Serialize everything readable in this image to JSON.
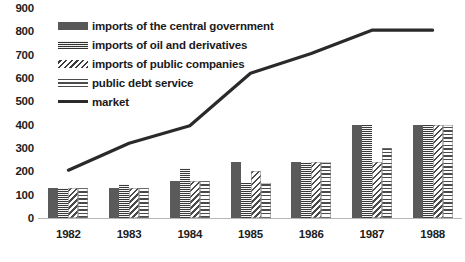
{
  "chart_data": {
    "type": "bar",
    "title": "",
    "subtitle": "",
    "xlabel": "",
    "ylabel": "",
    "categories": [
      "1982",
      "1983",
      "1984",
      "1985",
      "1986",
      "1987",
      "1988"
    ],
    "ylim": [
      0,
      900
    ],
    "y_ticks": [
      0,
      100,
      200,
      300,
      400,
      500,
      600,
      700,
      800,
      900
    ],
    "y_tick_labels": [
      "0",
      "100",
      "200",
      "300",
      "400",
      "500",
      "600",
      "700",
      "800",
      "900"
    ],
    "grid": false,
    "legend_position": "top-left",
    "series": [
      {
        "name": "imports of the central government",
        "kind": "bar",
        "pattern": "solid",
        "values": [
          130,
          130,
          160,
          240,
          240,
          400,
          400
        ]
      },
      {
        "name": "imports of oil and derivatives",
        "kind": "bar",
        "pattern": "dots",
        "values": [
          130,
          145,
          215,
          150,
          240,
          400,
          400
        ]
      },
      {
        "name": "imports of public companies",
        "kind": "bar",
        "pattern": "diagonal",
        "values": [
          130,
          130,
          160,
          200,
          240,
          240,
          400
        ]
      },
      {
        "name": "public debt service",
        "kind": "bar",
        "pattern": "horizontal",
        "values": [
          130,
          130,
          160,
          150,
          240,
          300,
          400
        ]
      },
      {
        "name": "market",
        "kind": "line",
        "pattern": "line",
        "values": [
          205,
          320,
          395,
          620,
          705,
          805,
          805
        ]
      }
    ]
  },
  "legend": {
    "items": [
      {
        "label": "imports of the central government",
        "swatch": "solid-swatch-icon"
      },
      {
        "label": "imports of oil and derivatives",
        "swatch": "dotted-swatch-icon"
      },
      {
        "label": "imports of public companies",
        "swatch": "diagonal-hatch-swatch-icon"
      },
      {
        "label": "public debt service",
        "swatch": "horizontal-lines-swatch-icon"
      },
      {
        "label": "market",
        "swatch": "line-swatch-icon"
      }
    ]
  },
  "colors": {
    "bar_solid": "#5a5a5a",
    "bar_dots": "#4a4a4a",
    "hatch": "#4a4a4a",
    "line": "#2a2a2a",
    "text": "#1d1d1d",
    "baseline": "#b7b7b7",
    "background": "#ffffff"
  }
}
